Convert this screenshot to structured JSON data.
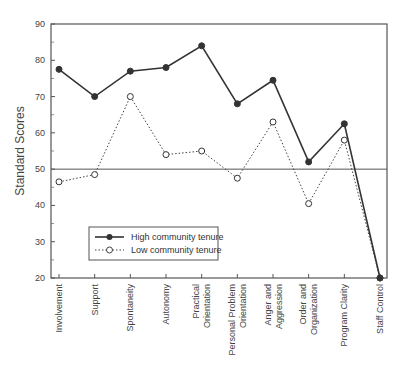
{
  "chart_data": {
    "type": "line",
    "title": "",
    "xlabel": "",
    "ylabel": "Standard Scores",
    "ylim": [
      20,
      90
    ],
    "yticks": [
      20,
      30,
      40,
      50,
      60,
      70,
      80,
      90
    ],
    "grid": false,
    "reference_line": 50,
    "legend_position": "lower left (inside plot)",
    "categories": [
      "Involvement",
      "Support",
      "Spontaneity",
      "Autonomy",
      "Practical Orientation",
      "Personal Problem Orientation",
      "Anger and Aggression",
      "Order and Organization",
      "Program Clarity",
      "Staff Control"
    ],
    "category_lines": [
      [
        "Involvement"
      ],
      [
        "Support"
      ],
      [
        "Spontaneity"
      ],
      [
        "Autonomy"
      ],
      [
        "Practical",
        "Orientation"
      ],
      [
        "Personal Problem",
        "Orientation"
      ],
      [
        "Anger and",
        "Aggression"
      ],
      [
        "Order and",
        "Organization"
      ],
      [
        "Program Clarity"
      ],
      [
        "Staff Control"
      ]
    ],
    "series": [
      {
        "name": "High community tenure",
        "style": "solid",
        "marker": "filled-circle",
        "values": [
          77.5,
          70,
          77,
          78,
          84,
          68,
          74.5,
          52,
          62.5,
          20
        ]
      },
      {
        "name": "Low community tenure",
        "style": "dotted",
        "marker": "open-circle",
        "values": [
          46.5,
          48.5,
          70,
          54,
          55,
          47.5,
          63,
          40.5,
          58,
          20
        ]
      }
    ]
  }
}
